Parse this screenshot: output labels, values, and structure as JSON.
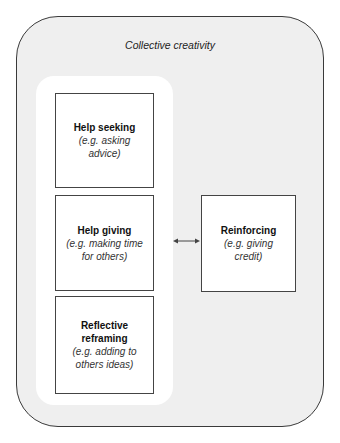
{
  "diagram": {
    "container_title": "Collective creativity",
    "boxes": [
      {
        "title": "Help seeking",
        "example": "(e.g. asking advice)"
      },
      {
        "title": "Help giving",
        "example": "(e.g. making time for others)"
      },
      {
        "title": "Reflective reframing",
        "example": "(e.g. adding to others ideas)"
      },
      {
        "title": "Reinforcing",
        "example": "(e.g. giving credit)"
      }
    ],
    "connector": "bidirectional-arrow"
  }
}
